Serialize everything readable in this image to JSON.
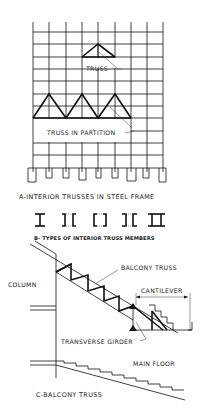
{
  "figure": {
    "section_a": {
      "caption": "A-INTERIOR TRUSSES IN STEEL FRAME",
      "labels": {
        "truss": "TRUSS",
        "truss_in_partition": "TRUSS IN PARTITION"
      }
    },
    "section_b": {
      "caption": "B- TYPES OF INTERIOR TRUSS MEMBERS",
      "member_types": [
        "I-beam",
        "double-angle",
        "double-channel",
        "angle-pair",
        "double-I"
      ]
    },
    "section_c": {
      "caption": "C-BALCONY TRUSS",
      "labels": {
        "column": "COLUMN",
        "balcony_truss": "BALCONY TRUSS",
        "cantilever": "CANTILEVER",
        "transverse_girder": "TRANSVERSE GIRDER",
        "main_floor": "MAIN FLOOR"
      }
    }
  }
}
